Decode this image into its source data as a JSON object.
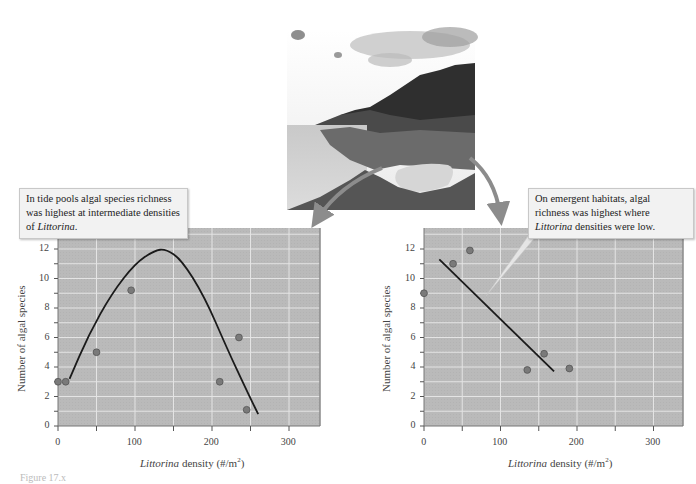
{
  "chart_data": [
    {
      "type": "scatter",
      "title": "",
      "annotation": "In tide pools algal species richness was highest at intermediate densities of Littorina.",
      "xlabel": "Littorina density (#/m2)",
      "ylabel": "Number of algal species",
      "xlim": [
        0,
        340
      ],
      "ylim": [
        0,
        13.5
      ],
      "xticks": [
        0,
        100,
        200,
        300
      ],
      "yticks": [
        0,
        2,
        4,
        6,
        8,
        10,
        12
      ],
      "grid": true,
      "points": [
        {
          "x": 0,
          "y": 3
        },
        {
          "x": 10,
          "y": 3
        },
        {
          "x": 50,
          "y": 5
        },
        {
          "x": 95,
          "y": 9.2
        },
        {
          "x": 210,
          "y": 3
        },
        {
          "x": 235,
          "y": 6
        },
        {
          "x": 245,
          "y": 1.1
        }
      ],
      "fit": {
        "kind": "hump-shaped curve",
        "x": [
          15,
          40,
          70,
          100,
          125,
          140,
          160,
          190,
          220,
          245,
          260
        ],
        "y": [
          3.2,
          6.2,
          9.0,
          11.0,
          11.9,
          12.0,
          11.3,
          8.8,
          5.2,
          2.4,
          0.8
        ]
      }
    },
    {
      "type": "scatter",
      "title": "",
      "annotation": "On emergent habitats, algal richness was highest where Littorina densities were low.",
      "xlabel": "Littorina density (#/m2)",
      "ylabel": "Number of algal species",
      "xlim": [
        0,
        340
      ],
      "ylim": [
        0,
        13.5
      ],
      "xticks": [
        0,
        100,
        200,
        300
      ],
      "yticks": [
        0,
        2,
        4,
        6,
        8,
        10,
        12
      ],
      "grid": true,
      "points": [
        {
          "x": 0,
          "y": 9
        },
        {
          "x": 38,
          "y": 11
        },
        {
          "x": 60,
          "y": 11.9
        },
        {
          "x": 135,
          "y": 3.8
        },
        {
          "x": 157,
          "y": 4.9
        },
        {
          "x": 190,
          "y": 3.9
        }
      ],
      "fit": {
        "kind": "linear",
        "x": [
          20,
          170
        ],
        "y": [
          11.3,
          3.7
        ]
      }
    }
  ],
  "left": {
    "callout_prefix": "In tide pools algal species richness was highest at intermediate densities of ",
    "callout_italic": "Littorina",
    "callout_suffix": ".",
    "ylabel": "Number of algal species",
    "xlabel_italic": "Littorina",
    "xlabel_rest": " density (#/m",
    "xlabel_sup": "2",
    "xlabel_close": ")"
  },
  "right": {
    "callout_prefix": "On emergent habitats, algal richness was highest where ",
    "callout_italic": "Littorina",
    "callout_suffix": " densities were low.",
    "ylabel": "Number of algal species",
    "xlabel_italic": "Littorina",
    "xlabel_rest": " density (#/m",
    "xlabel_sup": "2",
    "xlabel_close": ")"
  },
  "ticks": {
    "x": [
      "0",
      "100",
      "200",
      "300"
    ],
    "y": [
      "0",
      "2",
      "4",
      "6",
      "8",
      "10",
      "12"
    ]
  },
  "colors": {
    "plot_bg": "#b9b9b9",
    "grid": "#e6e6e6",
    "frame": "#8a8a8a",
    "point_fill": "#7a7a7a",
    "point_stroke": "#555555",
    "fit_line": "#1a1a1a",
    "arrow": "#8c8c8c"
  },
  "caption": "Figure 17.x"
}
